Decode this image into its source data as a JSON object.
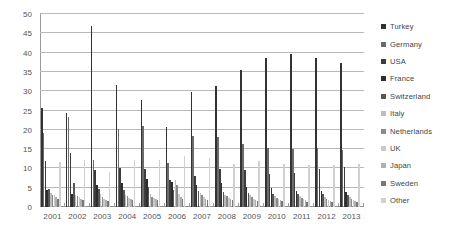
{
  "chart_data": {
    "type": "bar",
    "title": "",
    "xlabel": "",
    "ylabel": "",
    "ylim": [
      0,
      50
    ],
    "ytick_step": 5,
    "yticks": [
      50,
      45,
      40,
      35,
      30,
      25,
      20,
      15,
      10,
      5,
      0
    ],
    "grid": true,
    "legend_position": "right",
    "categories": [
      "2001",
      "2002",
      "2003",
      "2004",
      "2005",
      "2006",
      "2007",
      "2008",
      "2009",
      "2010",
      "2011",
      "2012",
      "2013"
    ],
    "series": [
      {
        "name": "Turkey",
        "color": "#333333",
        "values": [
          25.6,
          24.4,
          46.8,
          31.7,
          27.6,
          20.7,
          29.8,
          31.4,
          35.5,
          38.7,
          39.7,
          38.7,
          37.2
        ]
      },
      {
        "name": "Germany",
        "color": "#6b6b6b",
        "values": [
          19.3,
          23.4,
          12.1,
          20.2,
          20.9,
          11.4,
          18.3,
          18.1,
          16.4,
          15.2,
          15.1,
          15.3,
          14.7
        ]
      },
      {
        "name": "USA",
        "color": "#3d3d3d",
        "values": [
          11.9,
          13.9,
          9.7,
          10.2,
          9.9,
          6.9,
          8.1,
          9.8,
          9.5,
          8.6,
          8.8,
          9.8,
          10.4
        ]
      },
      {
        "name": "France",
        "color": "#2e2e2e",
        "values": [
          4.5,
          3.3,
          5.8,
          6.1,
          7.2,
          6.5,
          5.6,
          6.2,
          5.3,
          5.0,
          4.2,
          4.1,
          3.9
        ]
      },
      {
        "name": "Switzerland",
        "color": "#575757",
        "values": [
          4.7,
          6.3,
          4.6,
          4.4,
          5.1,
          4.3,
          4.2,
          4.0,
          3.7,
          3.5,
          3.4,
          3.3,
          3.2
        ]
      },
      {
        "name": "Italy",
        "color": "#bdbdbd",
        "values": [
          3.6,
          3.1,
          3.3,
          3.1,
          3.5,
          7.1,
          3.6,
          3.1,
          3.0,
          2.9,
          2.8,
          2.7,
          2.6
        ]
      },
      {
        "name": "Netherlands",
        "color": "#8a8a8a",
        "values": [
          3.2,
          2.9,
          2.6,
          2.8,
          2.7,
          5.7,
          3.1,
          2.8,
          2.5,
          2.4,
          2.3,
          2.2,
          2.1
        ]
      },
      {
        "name": "UK",
        "color": "#c9c9c9",
        "values": [
          3.0,
          2.5,
          2.2,
          2.4,
          2.3,
          3.3,
          2.7,
          2.4,
          2.2,
          2.1,
          2.0,
          1.9,
          1.8
        ]
      },
      {
        "name": "Japan",
        "color": "#b0b0b0",
        "values": [
          2.6,
          2.2,
          1.9,
          2.0,
          2.1,
          2.6,
          2.2,
          2.0,
          1.9,
          1.8,
          1.7,
          1.6,
          1.5
        ]
      },
      {
        "name": "Sweden",
        "color": "#787878",
        "values": [
          2.1,
          1.8,
          1.5,
          1.7,
          1.8,
          2.2,
          1.9,
          1.7,
          1.6,
          1.5,
          1.4,
          1.4,
          1.3
        ]
      },
      {
        "name": "Other",
        "color": "#d0d0d0",
        "values": [
          11.6,
          12.3,
          9.2,
          12.1,
          12.1,
          13.3,
          12.8,
          11.1,
          11.8,
          11.2,
          11.0,
          10.9,
          11.2
        ]
      }
    ]
  },
  "legend": {
    "items": [
      {
        "label": "Turkey"
      },
      {
        "label": "Germany"
      },
      {
        "label": "USA"
      },
      {
        "label": "France"
      },
      {
        "label": "Switzerland"
      },
      {
        "label": "Italy"
      },
      {
        "label": "Netherlands"
      },
      {
        "label": "UK"
      },
      {
        "label": "Japan"
      },
      {
        "label": "Sweden"
      },
      {
        "label": "Other"
      }
    ]
  }
}
